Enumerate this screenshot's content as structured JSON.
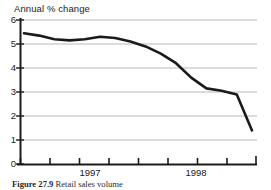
{
  "figure": {
    "caption_label": "Figure 27.9",
    "caption_text": "Retail sales volume",
    "background_color": "#ffffff"
  },
  "chart_data": {
    "type": "line",
    "title": "",
    "subtitle": "",
    "ylabel": "Annual % change",
    "xlabel": "",
    "ylim": [
      0,
      6
    ],
    "yticks": [
      0,
      1,
      2,
      3,
      4,
      5,
      6
    ],
    "ytick_labels": [
      "0",
      "1",
      "2",
      "3",
      "4",
      "5",
      "6"
    ],
    "xtick_labels": [
      "1997",
      "1998"
    ],
    "xtick_count": 9,
    "grid": "horizontal",
    "grid_color": "#b9b9b9",
    "legend": "none",
    "line_color": "#1a1a1a",
    "line_width": 2.6,
    "x": [
      0,
      1,
      2,
      3,
      4,
      5,
      6,
      7,
      8,
      9,
      10,
      11,
      12,
      13,
      14,
      15
    ],
    "values": [
      5.45,
      5.35,
      5.2,
      5.15,
      5.2,
      5.3,
      5.25,
      5.1,
      4.9,
      4.6,
      4.2,
      3.6,
      3.15,
      3.05,
      2.9,
      1.4
    ],
    "series": [
      {
        "name": "Retail sales volume",
        "values": [
          5.45,
          5.35,
          5.2,
          5.15,
          5.2,
          5.3,
          5.25,
          5.1,
          4.9,
          4.6,
          4.2,
          3.6,
          3.15,
          3.05,
          2.9,
          1.4
        ]
      }
    ],
    "annotations": []
  },
  "axes": {
    "y_title": "Annual % change",
    "y_labels": [
      "6",
      "5",
      "4",
      "3",
      "2",
      "1",
      "0"
    ],
    "x_labels": [
      {
        "text": "1997",
        "x": 90
      },
      {
        "text": "1998",
        "x": 196
      }
    ]
  }
}
